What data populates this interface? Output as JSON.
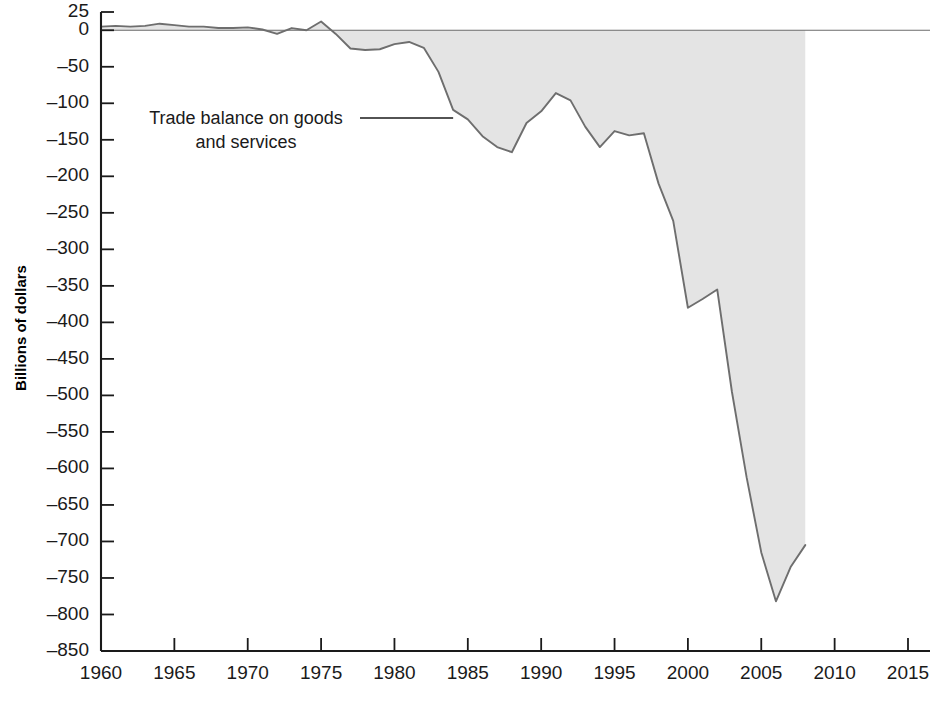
{
  "chart_data": {
    "type": "area",
    "title": "",
    "xlabel": "",
    "ylabel": "Billions of dollars",
    "xlim": [
      1960,
      2016.5
    ],
    "ylim": [
      -850,
      25
    ],
    "grid": false,
    "legend_position": "inline-annotation",
    "annotations": [
      {
        "name": "series-callout",
        "text_line1": "Trade balance on goods",
        "text_line2": "and services",
        "points_to_year": 1984,
        "points_to_value": -100
      }
    ],
    "series": [
      {
        "name": "Trade balance on goods and services",
        "fill_color": "#e4e4e4",
        "line_color": "#6e6e6e",
        "baseline": 0,
        "x": [
          1960,
          1961,
          1962,
          1963,
          1964,
          1965,
          1966,
          1967,
          1968,
          1969,
          1970,
          1971,
          1972,
          1973,
          1974,
          1975,
          1976,
          1977,
          1978,
          1979,
          1980,
          1981,
          1982,
          1983,
          1984,
          1985,
          1986,
          1987,
          1988,
          1989,
          1990,
          1991,
          1992,
          1993,
          1994,
          1995,
          1996,
          1997,
          1998,
          1999,
          2000,
          2001,
          2002,
          2003,
          2004,
          2005,
          2006,
          2007,
          2008
        ],
        "values": [
          5,
          6,
          5,
          6,
          9,
          7,
          5,
          5,
          3,
          3,
          4,
          1,
          -5,
          3,
          0,
          12,
          -5,
          -25,
          -27,
          -26,
          -19,
          -16,
          -24,
          -57,
          -109,
          -122,
          -145,
          -160,
          -167,
          -127,
          -111,
          -86,
          -96,
          -132,
          -160,
          -138,
          -144,
          -141,
          -210,
          -261,
          -380,
          -368,
          -355,
          -495,
          -612,
          -715,
          -782,
          -735,
          -705
        ],
        "units": "Billions of dollars"
      }
    ],
    "y_ticks": [
      25,
      0,
      -50,
      -100,
      -150,
      -200,
      -250,
      -300,
      -350,
      -400,
      -450,
      -500,
      -550,
      -600,
      -650,
      -700,
      -750,
      -800,
      -850
    ],
    "y_tick_labels": [
      "25",
      "0",
      "–50",
      "–100",
      "–150",
      "–200",
      "–250",
      "–300",
      "–350",
      "–400",
      "–450",
      "–500",
      "–550",
      "–600",
      "–650",
      "–700",
      "–750",
      "–800",
      "–850"
    ],
    "x_ticks": [
      1960,
      1965,
      1970,
      1975,
      1980,
      1985,
      1990,
      1995,
      2000,
      2005,
      2010,
      2015
    ],
    "x_tick_labels": [
      "1960",
      "1965",
      "1970",
      "1975",
      "1980",
      "1985",
      "1990",
      "1995",
      "2000",
      "2005",
      "2010",
      "2015"
    ]
  },
  "axis": {
    "y_title": "Billions of dollars"
  },
  "annotation": {
    "line1": "Trade balance on goods",
    "line2": "and services"
  },
  "colors": {
    "fill": "#e4e4e4",
    "line": "#6e6e6e",
    "axis": "#1a1a1a",
    "text": "#1a1a1a",
    "background": "#ffffff"
  }
}
